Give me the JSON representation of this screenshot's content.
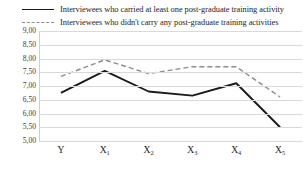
{
  "legend": {
    "position": "top-left",
    "entries": [
      {
        "style": "solid",
        "swatch_name": "legend-swatch-solid",
        "label": "Interviewees who carried at least one post-graduate training activity"
      },
      {
        "style": "dashed",
        "swatch_name": "legend-swatch-dashed",
        "label": "Interviewees who didn't carry any post-graduate training activities"
      }
    ]
  },
  "colors": {
    "solid_series": "#1a1a1a",
    "dashed_series": "#8c8c8c",
    "gridline": "#d9d9d9",
    "background": "#ffffff",
    "text": "#1c1c1c"
  },
  "axis": {
    "y_ticks": [
      "9,00",
      "8,50",
      "8,00",
      "7,50",
      "7,00",
      "6,50",
      "6,00",
      "5,50",
      "5,00"
    ],
    "x_ticks": [
      {
        "base": "Y",
        "sub": ""
      },
      {
        "base": "X",
        "sub": "1"
      },
      {
        "base": "X",
        "sub": "2"
      },
      {
        "base": "X",
        "sub": "3"
      },
      {
        "base": "X",
        "sub": "4"
      },
      {
        "base": "X",
        "sub": "5"
      }
    ]
  },
  "chart_data": {
    "type": "line",
    "title": "",
    "subtitle": "",
    "xlabel": "",
    "ylabel": "",
    "categories": [
      "Y",
      "X1",
      "X2",
      "X3",
      "X4",
      "X5"
    ],
    "ylim": [
      5.0,
      9.0
    ],
    "ytick_values": [
      9.0,
      8.5,
      8.0,
      7.5,
      7.0,
      6.5,
      6.0,
      5.5,
      5.0
    ],
    "ytick_labels": [
      "9,00",
      "8,50",
      "8,00",
      "7,50",
      "7,00",
      "6,50",
      "6,00",
      "5,50",
      "5,00"
    ],
    "grid": "horizontal",
    "legend": "top-left",
    "markers": false,
    "series": [
      {
        "name": "Interviewees who carried at least one post-graduate training activity",
        "style": "solid",
        "color": "#1a1a1a",
        "values": [
          6.75,
          7.55,
          6.8,
          6.65,
          7.1,
          5.5
        ]
      },
      {
        "name": "Interviewees who didn't carry any post-graduate training activities",
        "style": "dashed",
        "color": "#8c8c8c",
        "values": [
          7.35,
          7.95,
          7.45,
          7.7,
          7.7,
          6.6
        ]
      }
    ]
  }
}
